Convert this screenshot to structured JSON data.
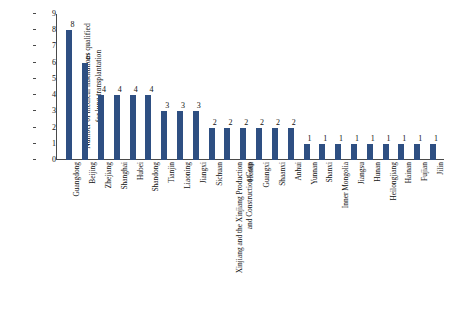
{
  "chart_data": {
    "type": "bar",
    "title": "",
    "xlabel": "",
    "ylabel_line1": "Number of medical institutions qualified",
    "ylabel_line2": "for lung transplantation",
    "ylim": [
      0,
      9
    ],
    "yticks": [
      "0",
      "1",
      "2",
      "3",
      "4",
      "5",
      "6",
      "7",
      "8",
      "9"
    ],
    "grid": false,
    "legend": "none",
    "bar_color": "#2e4f82",
    "categories": [
      "Guangdong",
      "Beijing",
      "Zhejiang",
      "Shanghai",
      "Hubei",
      "Shandong",
      "Tianjin",
      "Liaoning",
      "Jiangxi",
      "Sichuan",
      "Xinjiang and the Xinjiang Production and Construction Corp",
      "Henan",
      "Guangxi",
      "Shaanxi",
      "Anhui",
      "Yunnan",
      "Shanxi",
      "Inner Mongolia",
      "Jiangsu",
      "Hunan",
      "Heilongjiang",
      "Hainan",
      "Fujian",
      "Jilin"
    ],
    "category_lines": [
      [
        "Guangdong"
      ],
      [
        "Beijing"
      ],
      [
        "Zhejiang"
      ],
      [
        "Shanghai"
      ],
      [
        "Hubei"
      ],
      [
        "Shandong"
      ],
      [
        "Tianjin"
      ],
      [
        "Liaoning"
      ],
      [
        "Jiangxi"
      ],
      [
        "Sichuan"
      ],
      [
        "Xinjiang and the Xinjiang Production",
        "and Construction Corp"
      ],
      [
        "Henan"
      ],
      [
        "Guangxi"
      ],
      [
        "Shaanxi"
      ],
      [
        "Anhui"
      ],
      [
        "Yunnan"
      ],
      [
        "Shanxi"
      ],
      [
        "Inner Mongolia"
      ],
      [
        "Jiangsu"
      ],
      [
        "Hunan"
      ],
      [
        "Heilongjiang"
      ],
      [
        "Hainan"
      ],
      [
        "Fujian"
      ],
      [
        "Jilin"
      ]
    ],
    "values": [
      8,
      6,
      4,
      4,
      4,
      4,
      3,
      3,
      3,
      2,
      2,
      2,
      2,
      2,
      2,
      1,
      1,
      1,
      1,
      1,
      1,
      1,
      1,
      1
    ],
    "value_labels": [
      "8",
      "6",
      "4",
      "4",
      "4",
      "4",
      "3",
      "3",
      "3",
      "2",
      "2",
      "2",
      "2",
      "2",
      "2",
      "1",
      "1",
      "1",
      "1",
      "1",
      "1",
      "1",
      "1",
      "1"
    ]
  }
}
